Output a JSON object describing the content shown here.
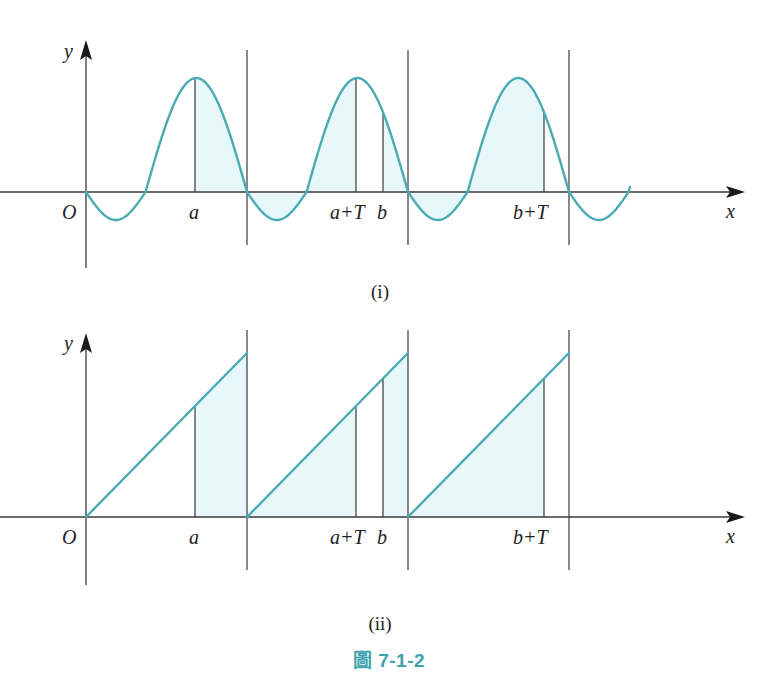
{
  "figure_caption": {
    "prefix": "圖",
    "number": "7-1-2"
  },
  "colors": {
    "curve": "#4aabb3",
    "shade": "#e8f7fa",
    "axis": "#3a3a3a",
    "caption": "#3fa3ad"
  },
  "chart_data": [
    {
      "type": "line",
      "title": "(i)",
      "function": "periodic sine-like wave with period T",
      "xlabel": "x",
      "ylabel": "y",
      "origin_label": "O",
      "tick_labels": [
        "a",
        "a+T",
        "b",
        "b+T"
      ],
      "period_boundaries_px": [
        86,
        247,
        408,
        569
      ],
      "marked_points": [
        {
          "label": "a",
          "x_px": 195
        },
        {
          "label": "a+T",
          "x_px": 356
        },
        {
          "label": "b",
          "x_px": 383
        },
        {
          "label": "b+T",
          "x_px": 544
        }
      ],
      "shaded_regions": [
        "a to T-boundary (247)",
        "247 to a+T",
        "b to 408",
        "408 to b+T"
      ],
      "grid": false
    },
    {
      "type": "line",
      "title": "(ii)",
      "function": "sawtooth (periodic linear ramp) with period T",
      "xlabel": "x",
      "ylabel": "y",
      "origin_label": "O",
      "tick_labels": [
        "a",
        "a+T",
        "b",
        "b+T"
      ],
      "period_boundaries_px": [
        86,
        247,
        408,
        569
      ],
      "marked_points": [
        {
          "label": "a",
          "x_px": 195
        },
        {
          "label": "a+T",
          "x_px": 356
        },
        {
          "label": "b",
          "x_px": 383
        },
        {
          "label": "b+T",
          "x_px": 544
        }
      ],
      "shaded_regions": [
        "a to 247",
        "247 to a+T",
        "b to 408",
        "408 to b+T"
      ],
      "grid": false
    }
  ],
  "panel_i": {
    "caption": "(i)",
    "y_label": "y",
    "x_label": "x",
    "origin": "O",
    "labels": {
      "a": "a",
      "aT": "a+T",
      "b": "b",
      "bT": "b+T"
    }
  },
  "panel_ii": {
    "caption": "(ii)",
    "y_label": "y",
    "x_label": "x",
    "origin": "O",
    "labels": {
      "a": "a",
      "aT": "a+T",
      "b": "b",
      "bT": "b+T"
    }
  }
}
